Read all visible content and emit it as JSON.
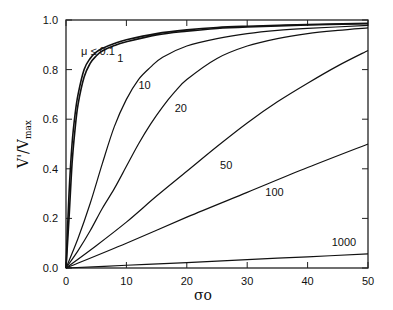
{
  "chart_data": {
    "type": "line",
    "title": "",
    "xlabel": "σo",
    "ylabel": "V'/Vmax",
    "xlim": [
      0,
      50
    ],
    "ylim": [
      0,
      1.0
    ],
    "xticks": [
      "0",
      "10",
      "20",
      "30",
      "40",
      "50"
    ],
    "yticks": [
      "0.0",
      "0.2",
      "0.4",
      "0.6",
      "0.8",
      "1.0"
    ],
    "grid": false,
    "legend": "inline curve labels",
    "series": [
      {
        "name": "μ ≤ 0.1",
        "label": "μ ≤ 0.1",
        "x": [
          0,
          0.5,
          1,
          1.5,
          2,
          3,
          4,
          5,
          6,
          8,
          10,
          15,
          20,
          25,
          30,
          40,
          50
        ],
        "y": [
          0,
          0.3,
          0.5,
          0.62,
          0.7,
          0.8,
          0.845,
          0.87,
          0.885,
          0.905,
          0.92,
          0.945,
          0.96,
          0.97,
          0.975,
          0.982,
          0.987
        ]
      },
      {
        "name": "μ = 1",
        "label": "1",
        "x": [
          0,
          0.5,
          1,
          1.5,
          2,
          3,
          4,
          5,
          6,
          8,
          10,
          15,
          20,
          25,
          30,
          40,
          50
        ],
        "y": [
          0,
          0.2,
          0.42,
          0.56,
          0.66,
          0.77,
          0.825,
          0.855,
          0.875,
          0.897,
          0.912,
          0.94,
          0.955,
          0.966,
          0.972,
          0.98,
          0.985
        ]
      },
      {
        "name": "μ = 10",
        "label": "10",
        "x": [
          0,
          2,
          4,
          6,
          8,
          10,
          12,
          14,
          16,
          20,
          25,
          30,
          35,
          40,
          50
        ],
        "y": [
          0,
          0.12,
          0.26,
          0.42,
          0.57,
          0.68,
          0.76,
          0.81,
          0.85,
          0.895,
          0.925,
          0.945,
          0.958,
          0.966,
          0.978
        ]
      },
      {
        "name": "μ = 20",
        "label": "20",
        "x": [
          0,
          2,
          4,
          6,
          8,
          10,
          12,
          14,
          16,
          18,
          20,
          25,
          30,
          35,
          40,
          45,
          50
        ],
        "y": [
          0,
          0.07,
          0.15,
          0.24,
          0.32,
          0.41,
          0.5,
          0.58,
          0.65,
          0.71,
          0.76,
          0.845,
          0.895,
          0.925,
          0.945,
          0.958,
          0.968
        ]
      },
      {
        "name": "μ = 50",
        "label": "50",
        "x": [
          0,
          5,
          10,
          15,
          20,
          25,
          30,
          35,
          40,
          45,
          50
        ],
        "y": [
          0,
          0.09,
          0.185,
          0.29,
          0.39,
          0.49,
          0.585,
          0.67,
          0.745,
          0.815,
          0.877
        ]
      },
      {
        "name": "μ = 100",
        "label": "100",
        "x": [
          0,
          10,
          20,
          30,
          40,
          50
        ],
        "y": [
          0,
          0.1,
          0.205,
          0.305,
          0.405,
          0.5
        ]
      },
      {
        "name": "μ = 1000",
        "label": "1000",
        "x": [
          0,
          10,
          20,
          30,
          40,
          50
        ],
        "y": [
          0,
          0.011,
          0.022,
          0.034,
          0.045,
          0.057
        ]
      }
    ],
    "annotations": [
      {
        "text": "μ ≤ 0.1",
        "x": 2.5,
        "y": 0.86
      },
      {
        "text": "1",
        "x": 8.5,
        "y": 0.83
      },
      {
        "text": "10",
        "x": 12,
        "y": 0.72
      },
      {
        "text": "20",
        "x": 18,
        "y": 0.63
      },
      {
        "text": "50",
        "x": 25.5,
        "y": 0.4
      },
      {
        "text": "100",
        "x": 33,
        "y": 0.29
      },
      {
        "text": "1000",
        "x": 44,
        "y": 0.09
      }
    ]
  }
}
